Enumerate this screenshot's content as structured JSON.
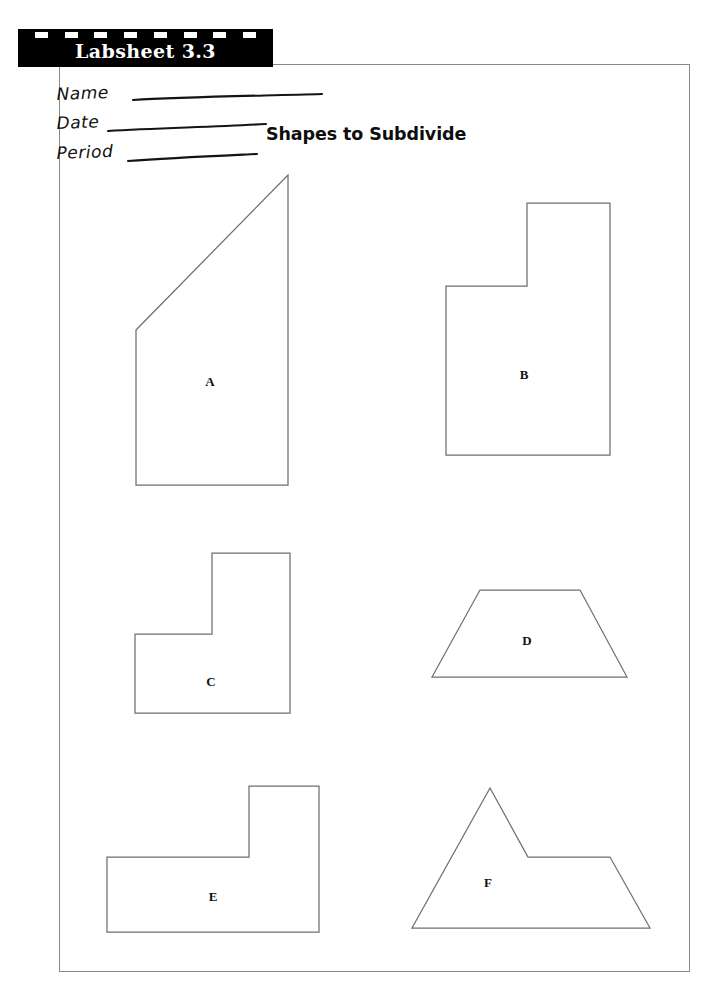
{
  "banner": {
    "title": "Labsheet 3.3",
    "dash_count": 8,
    "background_color": "#000000",
    "text_color": "#ffffff"
  },
  "handwriting": {
    "name_label": "Name",
    "date_label": "Date",
    "period_label": "Period"
  },
  "worksheet": {
    "title": "Shapes to Subdivide",
    "border_color": "#8a8a8a",
    "shape_stroke_color": "#6e6e6e"
  },
  "shapes": [
    {
      "label": "A",
      "kind": "right-trapezoid",
      "description": "Right trapezoid with slanted top-left edge",
      "points": "136,330 288,175 288,485 136,485",
      "label_x": 210,
      "label_y": 382
    },
    {
      "label": "B",
      "kind": "l-shape",
      "description": "L-shaped hexagon with notch cut from upper left",
      "points": "446,286 527,286 527,203 610,203 610,455 446,455",
      "label_x": 524,
      "label_y": 375
    },
    {
      "label": "C",
      "kind": "l-shape",
      "description": "L-shaped hexagon with notch cut from upper left",
      "points": "135,634 212,634 212,553 290,553 290,713 135,713",
      "label_x": 211,
      "label_y": 682
    },
    {
      "label": "D",
      "kind": "trapezoid",
      "description": "Isosceles trapezoid, longer base at the bottom",
      "points": "480,590 580,590 627,677 432,677",
      "label_x": 527,
      "label_y": 641
    },
    {
      "label": "E",
      "kind": "l-shape",
      "description": "L-shaped hexagon with tall block on the right",
      "points": "107,857 249,857 249,786 319,786 319,932 107,932",
      "label_x": 213,
      "label_y": 897
    },
    {
      "label": "F",
      "kind": "triangle-with-plateau",
      "description": "Triangular peak with a flat plateau ledge on the right",
      "points": "412,928 490,788 528,857 610,857 650,928",
      "label_x": 488,
      "label_y": 883
    }
  ]
}
